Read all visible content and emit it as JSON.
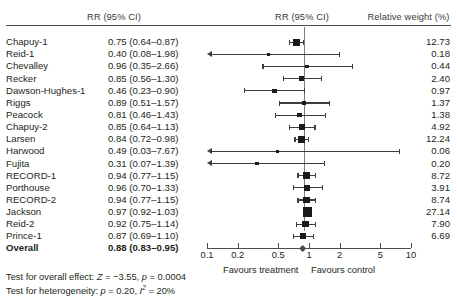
{
  "headers": {
    "rr_text": "RR (95% CI)",
    "rr_plot": "RR (95% CI)",
    "weight": "Relative weight (%)"
  },
  "chart_data": {
    "type": "forest",
    "title": "",
    "xlabel": "",
    "ylabel": "",
    "xscale": "log",
    "xlim": [
      0.1,
      10
    ],
    "xticks": [
      0.1,
      0.2,
      0.5,
      1,
      2,
      5,
      10
    ],
    "xticklabels": [
      "0.1",
      "0.2",
      "0.5",
      "1",
      "2",
      "5",
      "10"
    ],
    "reference_line": 1,
    "left_axis_label": "Favours treatment",
    "right_axis_label": "Favours control",
    "effect_measure": "RR (95% CI)",
    "weight_label": "Relative weight (%)",
    "grid": false,
    "legend": "none",
    "studies": [
      {
        "name": "Chapuy-1",
        "rr": 0.75,
        "lo": 0.64,
        "hi": 0.87,
        "ci_text": "0.75 (0.64–0.87)",
        "weight": 12.73,
        "weight_text": "12.73",
        "arrow_left": false
      },
      {
        "name": "Reid-1",
        "rr": 0.4,
        "lo": 0.08,
        "hi": 1.98,
        "ci_text": "0.40 (0.08–1.98)",
        "weight": 0.18,
        "weight_text": "0.18",
        "arrow_left": true
      },
      {
        "name": "Chevalley",
        "rr": 0.96,
        "lo": 0.35,
        "hi": 2.66,
        "ci_text": "0.96 (0.35–2.66)",
        "weight": 0.44,
        "weight_text": "0.44",
        "arrow_left": false
      },
      {
        "name": "Recker",
        "rr": 0.85,
        "lo": 0.56,
        "hi": 1.3,
        "ci_text": "0.85 (0.56–1.30)",
        "weight": 2.4,
        "weight_text": "2.40",
        "arrow_left": false
      },
      {
        "name": "Dawson-Hughes-1",
        "rr": 0.46,
        "lo": 0.23,
        "hi": 0.9,
        "ci_text": "0.46 (0.23–0.90)",
        "weight": 0.97,
        "weight_text": "0.97",
        "arrow_left": false
      },
      {
        "name": "Riggs",
        "rr": 0.89,
        "lo": 0.51,
        "hi": 1.57,
        "ci_text": "0.89 (0.51–1.57)",
        "weight": 1.37,
        "weight_text": "1.37",
        "arrow_left": false
      },
      {
        "name": "Peacock",
        "rr": 0.81,
        "lo": 0.46,
        "hi": 1.43,
        "ci_text": "0.81 (0.46–1.43)",
        "weight": 1.38,
        "weight_text": "1.38",
        "arrow_left": false
      },
      {
        "name": "Chapuy-2",
        "rr": 0.85,
        "lo": 0.64,
        "hi": 1.13,
        "ci_text": "0.85 (0.64–1.13)",
        "weight": 4.92,
        "weight_text": "4.92",
        "arrow_left": false
      },
      {
        "name": "Larsen",
        "rr": 0.84,
        "lo": 0.72,
        "hi": 0.98,
        "ci_text": "0.84 (0.72–0.98)",
        "weight": 12.24,
        "weight_text": "12.24",
        "arrow_left": false
      },
      {
        "name": "Harwood",
        "rr": 0.49,
        "lo": 0.03,
        "hi": 7.67,
        "ci_text": "0.49 (0.03–7.67)",
        "weight": 0.06,
        "weight_text": "0.06",
        "arrow_left": true
      },
      {
        "name": "Fujita",
        "rr": 0.31,
        "lo": 0.07,
        "hi": 1.39,
        "ci_text": "0.31 (0.07–1.39)",
        "weight": 0.2,
        "weight_text": "0.20",
        "arrow_left": true
      },
      {
        "name": "RECORD-1",
        "rr": 0.94,
        "lo": 0.77,
        "hi": 1.15,
        "ci_text": "0.94 (0.77–1.15)",
        "weight": 8.72,
        "weight_text": "8.72",
        "arrow_left": false
      },
      {
        "name": "Porthouse",
        "rr": 0.96,
        "lo": 0.7,
        "hi": 1.33,
        "ci_text": "0.96 (0.70–1.33)",
        "weight": 3.91,
        "weight_text": "3.91",
        "arrow_left": false
      },
      {
        "name": "RECORD-2",
        "rr": 0.94,
        "lo": 0.77,
        "hi": 1.15,
        "ci_text": "0.94 (0.77–1.15)",
        "weight": 8.74,
        "weight_text": "8.74",
        "arrow_left": false
      },
      {
        "name": "Jackson",
        "rr": 0.97,
        "lo": 0.92,
        "hi": 1.03,
        "ci_text": "0.97 (0.92–1.03)",
        "weight": 27.14,
        "weight_text": "27.14",
        "arrow_left": false
      },
      {
        "name": "Reid-2",
        "rr": 0.92,
        "lo": 0.75,
        "hi": 1.14,
        "ci_text": "0.92 (0.75–1.14)",
        "weight": 7.9,
        "weight_text": "7.90",
        "arrow_left": false
      },
      {
        "name": "Prince-1",
        "rr": 0.87,
        "lo": 0.69,
        "hi": 1.1,
        "ci_text": "0.87 (0.69–1.10)",
        "weight": 6.69,
        "weight_text": "6.69",
        "arrow_left": false
      }
    ],
    "overall": {
      "name": "Overall",
      "rr": 0.88,
      "lo": 0.83,
      "hi": 0.95,
      "ci_text": "0.88 (0.83–0.95)",
      "weight_text": ""
    }
  },
  "stats": {
    "overall_effect": {
      "prefix": "Test for overall effect: ",
      "z_symbol": "Z",
      "z_value": " = −3.55, ",
      "p_symbol": "p",
      "p_value": " = 0.0004"
    },
    "heterogeneity": {
      "prefix": "Test for heterogeneity: ",
      "p_symbol": "p",
      "p_value": " = 0.20, ",
      "i_symbol": "I",
      "i_sup": "2",
      "i_value": " = 20%"
    }
  },
  "colors": {
    "marker": "#1a1a1a",
    "whisker": "#3d3d3d",
    "refline": "#7d7d7d",
    "axis": "#4c4c4c",
    "text": "#231f20",
    "diamond": "#4a4a4a"
  }
}
